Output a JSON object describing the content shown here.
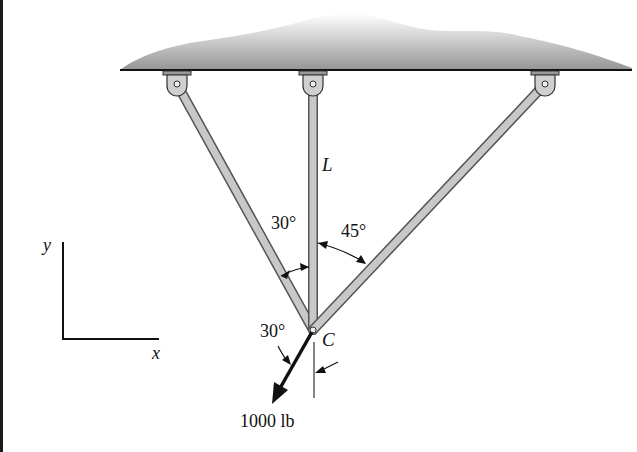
{
  "figure": {
    "labels": {
      "member_label": "L",
      "angle_left": "30°",
      "angle_right": "45°",
      "joint_label": "C",
      "force_angle": "30°",
      "force_value": "1000 lb",
      "axis_y": "y",
      "axis_x": "x"
    },
    "colors": {
      "member_fill": "#c4c4c4",
      "member_edge": "#555555",
      "ceiling_shade": "#9a9a9a",
      "ink": "#111111"
    },
    "geometry": {
      "joint_C": [
        313,
        330
      ],
      "supports": [
        [
          177,
          83
        ],
        [
          313,
          83
        ],
        [
          545,
          83
        ]
      ],
      "angle_left_deg": 30,
      "angle_right_deg": 45,
      "force_angle_from_vertical_deg": 30
    }
  }
}
